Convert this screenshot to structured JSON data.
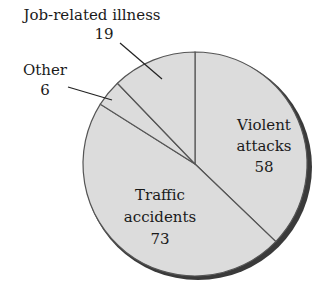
{
  "chart_data": {
    "type": "pie",
    "title": "",
    "categories": [
      "Violent attacks",
      "Traffic accidents",
      "Other",
      "Job-related illness"
    ],
    "values": [
      58,
      73,
      6,
      19
    ],
    "start_angle_deg": 0,
    "direction": "clockwise",
    "legend": "none",
    "labels": [
      {
        "name": "Violent",
        "name2": "attacks",
        "value": "58",
        "position": "inside"
      },
      {
        "name": "Traffic",
        "name2": "accidents",
        "value": "73",
        "position": "inside"
      },
      {
        "name": "Other",
        "value": "6",
        "position": "outside-leader"
      },
      {
        "name": "Job-related illness",
        "value": "19",
        "position": "outside-leader"
      }
    ]
  },
  "colors": {
    "slice_fill": "#dcdcdc",
    "slice_stroke": "#555555",
    "shadow": "#3a3a3a",
    "text": "#1a1a1a"
  }
}
